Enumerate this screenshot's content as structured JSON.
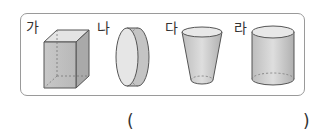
{
  "figures": [
    {
      "label": "가",
      "shape": "rectangular-prism"
    },
    {
      "label": "나",
      "shape": "cylinder-lying-sideways"
    },
    {
      "label": "다",
      "shape": "truncated-cone-cup"
    },
    {
      "label": "라",
      "shape": "cylinder"
    }
  ],
  "answer": {
    "open": "(",
    "close": ")",
    "value": ""
  }
}
